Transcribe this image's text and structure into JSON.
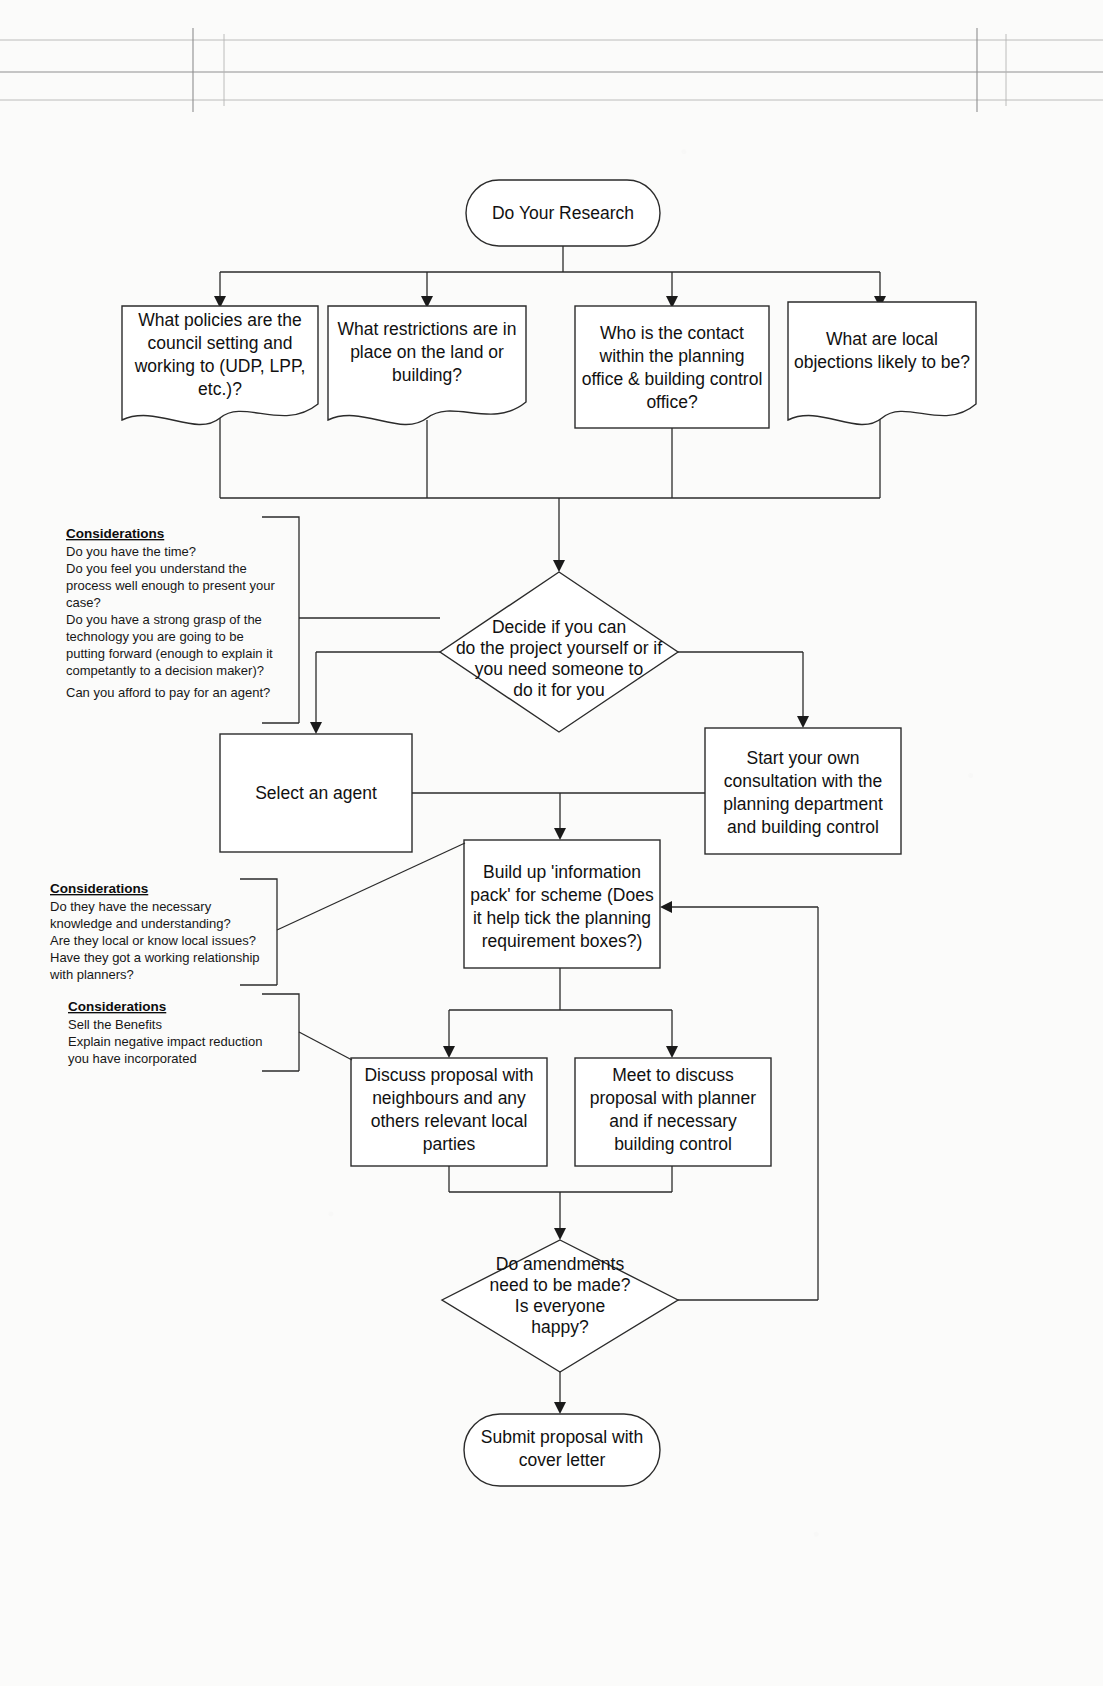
{
  "document": {
    "kind": "flowchart",
    "title": "Planning Application Process Flowchart",
    "scan_artifacts": {
      "registration_marks": "crop and fold register lines across top of scanned page"
    }
  },
  "nodes": {
    "start": {
      "id": "start",
      "shape": "rounded-terminator",
      "label": "Do Your Research",
      "lines": [
        "Do Your Research"
      ]
    },
    "research_1": {
      "id": "research-policies",
      "shape": "document",
      "lines": [
        "What policies are the",
        "council setting and",
        "working to (UDP, LPP,",
        "etc.)?"
      ]
    },
    "research_2": {
      "id": "research-restrictions",
      "shape": "document",
      "lines": [
        "What restrictions are in",
        "place on the land or",
        "building?"
      ]
    },
    "research_3": {
      "id": "research-contact",
      "shape": "rectangle",
      "lines": [
        "Who is the contact",
        "within the planning",
        "office & building control",
        "office?"
      ]
    },
    "research_4": {
      "id": "research-objections",
      "shape": "document",
      "lines": [
        "What are local",
        "objections likely to be?"
      ]
    },
    "decide": {
      "id": "decide-diy-or-agent",
      "shape": "diamond",
      "lines": [
        "Decide if you can",
        "do the project yourself or if",
        "you need someone to",
        "do it for you"
      ]
    },
    "select_agent": {
      "id": "select-an-agent",
      "shape": "rectangle",
      "lines": [
        "Select an agent"
      ]
    },
    "own_consultation": {
      "id": "start-own-consultation",
      "shape": "rectangle",
      "lines": [
        "Start your own",
        "consultation with the",
        "planning department",
        "and building control"
      ]
    },
    "info_pack": {
      "id": "build-information-pack",
      "shape": "rectangle",
      "lines": [
        "Build up 'information",
        "pack' for scheme (Does",
        "it help tick the planning",
        "requirement  boxes?)"
      ]
    },
    "discuss_neighbours": {
      "id": "discuss-with-neighbours",
      "shape": "rectangle",
      "lines": [
        "Discuss proposal with",
        "neighbours and any",
        "others relevant local",
        "parties"
      ]
    },
    "meet_planner": {
      "id": "meet-with-planner",
      "shape": "rectangle",
      "lines": [
        "Meet to discuss",
        "proposal with planner",
        "and if necessary",
        "building control"
      ]
    },
    "amendments": {
      "id": "amendments-decision",
      "shape": "diamond",
      "lines": [
        "Do amendments",
        "need to be made?",
        "Is everyone",
        "happy?"
      ]
    },
    "submit": {
      "id": "submit-proposal",
      "shape": "rounded-terminator",
      "lines": [
        "Submit proposal with",
        "cover letter"
      ]
    }
  },
  "annotations": {
    "considerations_diy": {
      "heading": "Considerations",
      "lines": [
        "Do you have the time?",
        "Do you feel you understand the",
        "process well enough to present your",
        "case?",
        "Do you have a strong grasp of the",
        "technology you are going to be",
        "putting forward (enough to explain it",
        "competantly to a decision maker)?",
        "Can you afford to pay for an agent?"
      ]
    },
    "considerations_agent": {
      "heading": "Considerations",
      "lines": [
        "Do they have the necessary",
        "knowledge and understanding?",
        "Are they local or know local issues?",
        "Have they got a working relationship",
        "with planners?"
      ]
    },
    "considerations_pitch": {
      "heading": "Considerations",
      "lines": [
        "Sell the Benefits",
        "Explain negative impact reduction",
        "you have incorporated"
      ]
    }
  },
  "colors": {
    "stroke": "#2b2b2b",
    "text": "#111111",
    "paper": "#fbfbfa",
    "register": "#8f8f8f"
  }
}
